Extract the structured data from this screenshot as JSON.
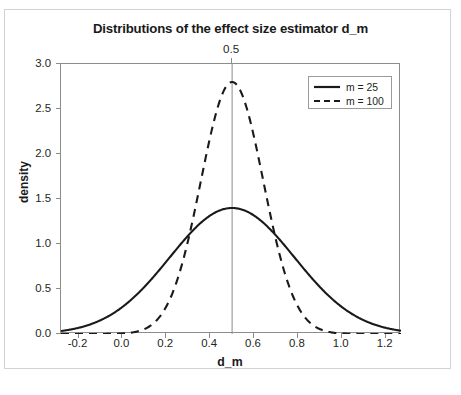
{
  "chart_data": {
    "type": "line",
    "title": "Distributions of the effect size estimator d_m",
    "xlabel": "d_m",
    "ylabel": "density",
    "xlim": [
      -0.28,
      1.27
    ],
    "ylim": [
      0.0,
      3.0
    ],
    "xticks": [
      "-0.2",
      "0.0",
      "0.2",
      "0.4",
      "0.6",
      "0.8",
      "1.0",
      "1.2"
    ],
    "xtick_values": [
      -0.2,
      0.0,
      0.2,
      0.4,
      0.6,
      0.8,
      1.0,
      1.2
    ],
    "yticks": [
      "0.0",
      "0.5",
      "1.0",
      "1.5",
      "2.0",
      "2.5",
      "3.0"
    ],
    "ytick_values": [
      0.0,
      0.5,
      1.0,
      1.5,
      2.0,
      2.5,
      3.0
    ],
    "grid": false,
    "legend_position": "top-right",
    "reference_line": {
      "orientation": "vertical",
      "value": 0.5,
      "label": "0.5",
      "color": "#8c8c8c"
    },
    "series": [
      {
        "name": "m = 25",
        "style": "solid",
        "color": "#1a1a1a",
        "mean": 0.5,
        "sd": 0.285,
        "peak_density": 1.4,
        "x": [
          -0.28,
          -0.2,
          -0.1,
          0.0,
          0.1,
          0.2,
          0.3,
          0.4,
          0.5,
          0.6,
          0.7,
          0.8,
          0.9,
          1.0,
          1.1,
          1.2,
          1.27
        ],
        "values": [
          0.03,
          0.05,
          0.12,
          0.23,
          0.41,
          0.66,
          0.96,
          1.25,
          1.4,
          1.25,
          0.96,
          0.66,
          0.41,
          0.23,
          0.12,
          0.05,
          0.03
        ]
      },
      {
        "name": "m = 100",
        "style": "dashed",
        "color": "#1a1a1a",
        "mean": 0.5,
        "sd": 0.1425,
        "peak_density": 2.8,
        "x": [
          -0.28,
          -0.2,
          -0.1,
          0.0,
          0.1,
          0.2,
          0.3,
          0.4,
          0.5,
          0.6,
          0.7,
          0.8,
          0.9,
          1.0,
          1.1,
          1.2,
          1.27
        ],
        "values": [
          0.0,
          0.0,
          0.0,
          0.0,
          0.02,
          0.2,
          0.93,
          2.18,
          2.8,
          2.18,
          0.93,
          0.2,
          0.02,
          0.0,
          0.0,
          0.0,
          0.0
        ]
      }
    ]
  },
  "legend": {
    "items": [
      {
        "label": "m = 25"
      },
      {
        "label": "m = 100"
      }
    ]
  }
}
